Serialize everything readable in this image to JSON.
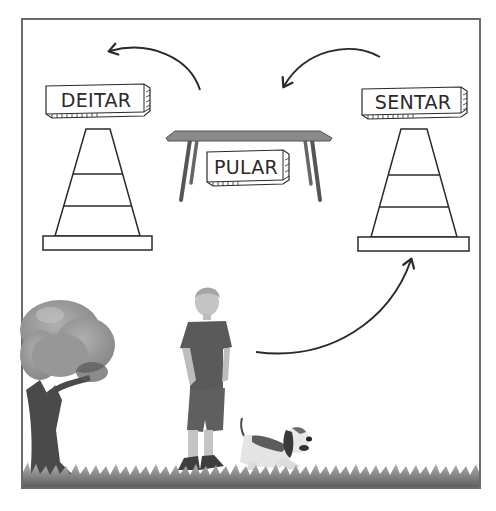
{
  "scene": {
    "description": "Dog agility training circuit illustration",
    "labels": {
      "left_cone": "DEITAR",
      "table": "PULAR",
      "right_cone": "SENTAR"
    },
    "objects": [
      "left-cone",
      "table",
      "right-cone",
      "tree",
      "boy",
      "dog",
      "grass"
    ],
    "arrows": [
      {
        "from": "boy",
        "to": "right-cone"
      },
      {
        "from": "right-cone",
        "to": "table"
      },
      {
        "from": "table",
        "to": "left-cone"
      }
    ],
    "colors": {
      "frame": "#6b6b6b",
      "line": "#2a2a2a",
      "table_top": "#8a8a8a",
      "table_leg": "#555555",
      "shirt": "#5a5a5a",
      "skin": "#bdbdbd",
      "grass": "#7a7a7a",
      "tree_crown": "#9a9a9a",
      "tree_trunk": "#4a4a4a"
    }
  }
}
